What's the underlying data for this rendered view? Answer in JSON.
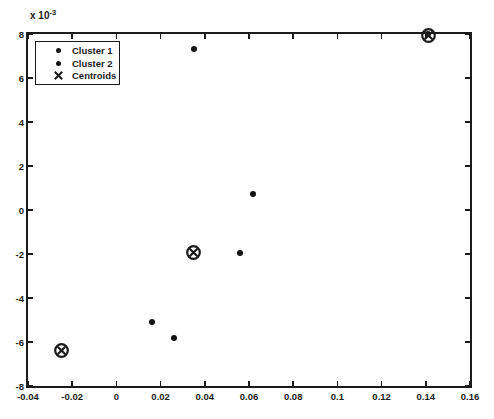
{
  "figure": {
    "background": "#ffffff",
    "ink": "#1b1b1b"
  },
  "chart_data": {
    "type": "scatter",
    "title": "",
    "xlabel": "",
    "ylabel": "",
    "y_offset_label": {
      "text": "x 10",
      "exponent": "-3"
    },
    "x": {
      "min": -0.04,
      "max": 0.16,
      "ticks": [
        -0.04,
        -0.02,
        0,
        0.02,
        0.04,
        0.06,
        0.08,
        0.1,
        0.12,
        0.14,
        0.16
      ],
      "tick_labels": [
        "-0.04",
        "-0.02",
        "0",
        "0.02",
        "0.04",
        "0.06",
        "0.08",
        "0.1",
        "0.12",
        "0.14",
        "0.16"
      ]
    },
    "y": {
      "min": -8,
      "max": 8,
      "units": "1e-3",
      "ticks": [
        8,
        6,
        4,
        2,
        0,
        -2,
        -4,
        -6,
        -8
      ],
      "tick_labels": [
        "8",
        "6",
        "4",
        "2",
        "0",
        "-2",
        "-4",
        "-6",
        "-8"
      ]
    },
    "grid": false,
    "legend": {
      "position": "top-left",
      "entries": [
        {
          "label": "Cluster 1",
          "marker": "dot"
        },
        {
          "label": "Cluster 2",
          "marker": "dot"
        },
        {
          "label": "Centroids",
          "marker": "x"
        }
      ]
    },
    "series": [
      {
        "name": "Cluster 1",
        "marker": "dot",
        "points": [
          [
            0.035,
            7.3
          ],
          [
            0.062,
            0.75
          ],
          [
            0.056,
            -1.95
          ],
          [
            0.141,
            8.0
          ]
        ]
      },
      {
        "name": "Cluster 2",
        "marker": "dot",
        "points": [
          [
            0.016,
            -5.1
          ],
          [
            0.026,
            -5.8
          ]
        ]
      },
      {
        "name": "Centroids",
        "marker": "circle-x",
        "points": [
          [
            0.035,
            -1.95
          ],
          [
            0.141,
            7.95
          ],
          [
            -0.025,
            -6.4
          ]
        ]
      }
    ]
  }
}
